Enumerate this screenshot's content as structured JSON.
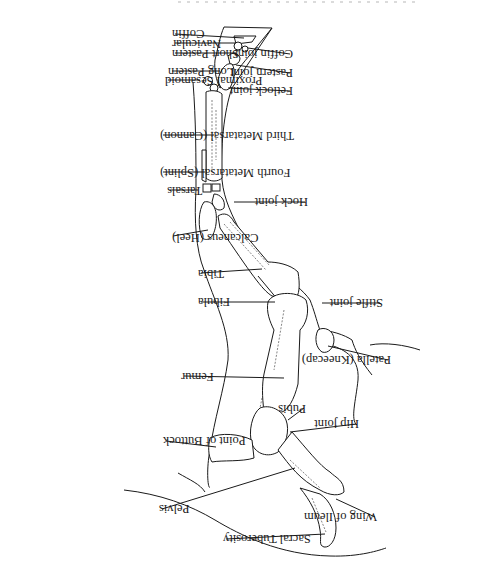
{
  "figure": {
    "orientation": "rotated 180 degrees (upside-down)",
    "caption_partial": "",
    "labels_left": [
      {
        "id": "coffin",
        "text": "Coffin"
      },
      {
        "id": "navicular",
        "text": "Navicular"
      },
      {
        "id": "short_pastern",
        "text": "Short Pastern"
      },
      {
        "id": "long_pastern",
        "text": "Long Pastern"
      },
      {
        "id": "proximal_sesamoid",
        "text": "Proximal Sesamoid"
      },
      {
        "id": "third_metatarsal",
        "text": "Third Metatarsal (Cannon)"
      },
      {
        "id": "fourth_metatarsal",
        "text": "Fourth Metatarsal (Splint)"
      },
      {
        "id": "tarsals",
        "text": "Tarsals"
      },
      {
        "id": "calcaneus",
        "text": "Calcaneus (Heel)"
      },
      {
        "id": "tibia",
        "text": "Tibia"
      },
      {
        "id": "fibula",
        "text": "Fibula"
      },
      {
        "id": "femur",
        "text": "Femur"
      },
      {
        "id": "point_of_buttock",
        "text": "Point of Buttock"
      },
      {
        "id": "pelvis",
        "text": "Pelvis"
      },
      {
        "id": "sacral_tuberosity",
        "text": "Sacral Tuberosity"
      }
    ],
    "labels_right": [
      {
        "id": "coffin_joint",
        "text": "Coffin joint"
      },
      {
        "id": "pastern_joint",
        "text": "Pastern joint"
      },
      {
        "id": "fetlock_joint",
        "text": "Fetlock joint"
      },
      {
        "id": "hock_joint",
        "text": "Hock joint"
      },
      {
        "id": "stifle_joint",
        "text": "Stifle joint"
      },
      {
        "id": "patella",
        "text": "Patella (Kneecap)"
      },
      {
        "id": "pubis",
        "text": "Pubis"
      },
      {
        "id": "hip_joint",
        "text": "Hip joint"
      },
      {
        "id": "wing_of_ileum",
        "text": "Wing of Ileum"
      }
    ]
  }
}
